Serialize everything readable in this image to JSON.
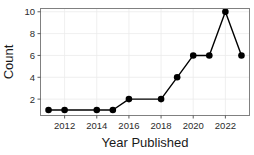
{
  "chart_data": {
    "type": "line",
    "title": "",
    "xlabel": "Year Published",
    "ylabel": "Count",
    "x": [
      2011,
      2012,
      2014,
      2015,
      2016,
      2018,
      2019,
      2020,
      2021,
      2022,
      2023
    ],
    "values": [
      1,
      1,
      1,
      1,
      2,
      2,
      4,
      6,
      6,
      10,
      6
    ],
    "series": [
      {
        "name": "Count",
        "x": [
          2011,
          2012,
          2014,
          2015,
          2016,
          2018,
          2019,
          2020,
          2021,
          2022,
          2023
        ],
        "values": [
          1,
          1,
          1,
          1,
          2,
          2,
          4,
          6,
          6,
          10,
          6
        ]
      }
    ],
    "xtick_labels": [
      "2012",
      "2014",
      "2016",
      "2018",
      "2020",
      "2022"
    ],
    "xtick_values": [
      2012,
      2014,
      2016,
      2018,
      2020,
      2022
    ],
    "ytick_labels": [
      "2",
      "4",
      "6",
      "8",
      "10"
    ],
    "ytick_values": [
      2,
      4,
      6,
      8,
      10
    ],
    "xlim": [
      2010.5,
      2023.5
    ],
    "ylim": [
      0.5,
      10.3
    ],
    "grid": true,
    "legend": "none",
    "marker": "circle",
    "line_color": "#000000",
    "marker_color": "#000000",
    "grid_color": "#ebebeb",
    "panel_border_color": "#808080",
    "background_color": "#ffffff"
  },
  "labels": {
    "y_axis_title": "Count",
    "x_axis_title": "Year Published"
  }
}
